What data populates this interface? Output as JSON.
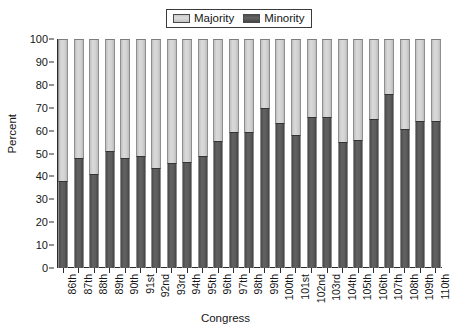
{
  "chart_data": {
    "type": "bar",
    "stacked": true,
    "stacked_total": 100,
    "title": "",
    "xlabel": "Congress",
    "ylabel": "Percent",
    "ylim": [
      0,
      100
    ],
    "yticks": [
      0,
      10,
      20,
      30,
      40,
      50,
      60,
      70,
      80,
      90,
      100
    ],
    "grid": false,
    "legend_position": "top-center",
    "categories": [
      "86th",
      "87th",
      "88th",
      "89th",
      "90th",
      "91st",
      "92nd",
      "93rd",
      "94th",
      "95th",
      "96th",
      "97th",
      "98th",
      "99th",
      "100th",
      "101st",
      "102nd",
      "103rd",
      "104th",
      "105th",
      "106th",
      "107th",
      "108th",
      "109th",
      "110th"
    ],
    "series": [
      {
        "name": "Minority",
        "color": "#555555",
        "values": [
          38,
          48,
          41,
          51,
          48,
          49,
          43.5,
          46,
          46.5,
          49,
          55.5,
          59.5,
          59.5,
          70,
          63.5,
          58,
          66,
          66,
          55,
          56,
          65,
          76,
          60.5,
          64,
          64
        ]
      },
      {
        "name": "Majority",
        "color": "#d2d2d2",
        "values": [
          62,
          52,
          59,
          49,
          52,
          51,
          56.5,
          54,
          53.5,
          51,
          44.5,
          40.5,
          40.5,
          30,
          36.5,
          42,
          34,
          34,
          45,
          44,
          35,
          24,
          39.5,
          36,
          36
        ]
      }
    ]
  },
  "legend": {
    "entries": [
      {
        "label": "Majority",
        "swatch": "majority"
      },
      {
        "label": "Minority",
        "swatch": "minority"
      }
    ]
  }
}
